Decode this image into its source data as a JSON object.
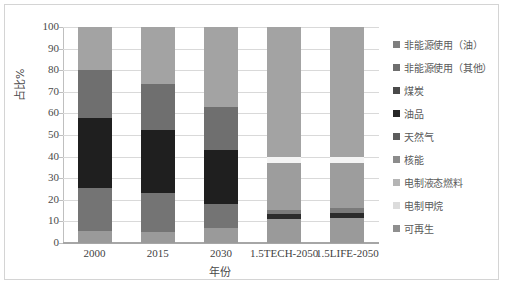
{
  "chart_data": {
    "type": "bar",
    "subtype": "stacked-100-percent",
    "title": "",
    "xlabel": "年份",
    "ylabel": "占比%",
    "ylim": [
      0,
      100
    ],
    "yticks": [
      0,
      10,
      20,
      30,
      40,
      50,
      60,
      70,
      80,
      90,
      100
    ],
    "ytick_labels": [
      "0",
      "10",
      "20",
      "30",
      "40",
      "50",
      "60",
      "70",
      "80",
      "90",
      "100"
    ],
    "grid": true,
    "legend_position": "right",
    "categories": [
      "2000",
      "2015",
      "2030",
      "1.5TECH-2050",
      "1.5LIFE-2050"
    ],
    "stack_order_bottom_up": [
      "可再生",
      "电制甲烷",
      "电制液态燃料",
      "核能",
      "天然气",
      "油品",
      "煤炭",
      "非能源使用（其他）",
      "非能源使用（油）"
    ],
    "series": [
      {
        "name": "可再生",
        "color": "#a6a6a6",
        "values": [
          5.5,
          5.0,
          7.0,
          11.0,
          11.5
        ]
      },
      {
        "name": "电制甲烷",
        "color": "#f2f2f2",
        "values": [
          0,
          0,
          0,
          0,
          0
        ]
      },
      {
        "name": "电制液态燃料",
        "color": "#d9d9d9",
        "values": [
          0,
          0,
          0,
          0,
          0
        ]
      },
      {
        "name": "核能",
        "color": "#8c8c8c",
        "values": [
          0,
          0,
          0,
          2.5,
          2.5
        ]
      },
      {
        "name": "天然气",
        "color": "#262626",
        "values": [
          0,
          0,
          0,
          2.5,
          2.5
        ]
      },
      {
        "name": "油品",
        "color": "#7f7f7f",
        "values": [
          20.0,
          18.0,
          11.0,
          21.0,
          20.5
        ]
      },
      {
        "name": "煤炭",
        "color": "#808080",
        "values": [
          0,
          0,
          0,
          0,
          0
        ]
      },
      {
        "name": "非能源使用（其他）",
        "color": "#f7f7f7",
        "values": [
          0,
          0,
          0,
          3.0,
          3.0
        ]
      },
      {
        "name": "非能源使用（油）",
        "color": "#a8a8a8",
        "values": [
          0,
          0,
          0,
          60.0,
          60.0
        ]
      }
    ],
    "bars": [
      {
        "category": "2000",
        "segments": [
          {
            "name": "可再生",
            "value": 5.5,
            "from": 0,
            "to": 5.5,
            "color": "#9a9a9a"
          },
          {
            "name": "天然气",
            "value": 20.0,
            "from": 5.5,
            "to": 25.5,
            "color": "#747474"
          },
          {
            "name": "油品",
            "value": 32.5,
            "from": 25.5,
            "to": 58.0,
            "color": "#1f1f1f"
          },
          {
            "name": "煤炭",
            "value": 22.0,
            "from": 58.0,
            "to": 80.0,
            "color": "#6f6f6f"
          },
          {
            "name": "非能源使用（其他）",
            "value": 20.0,
            "from": 80.0,
            "to": 100.0,
            "color": "#a3a3a3"
          }
        ]
      },
      {
        "category": "2015",
        "segments": [
          {
            "name": "可再生",
            "value": 5.0,
            "from": 0,
            "to": 5.0,
            "color": "#9a9a9a"
          },
          {
            "name": "天然气",
            "value": 18.0,
            "from": 5.0,
            "to": 23.0,
            "color": "#747474"
          },
          {
            "name": "油品",
            "value": 29.5,
            "from": 23.0,
            "to": 52.5,
            "color": "#1f1f1f"
          },
          {
            "name": "煤炭",
            "value": 21.0,
            "from": 52.5,
            "to": 73.5,
            "color": "#6f6f6f"
          },
          {
            "name": "非能源使用（其他）",
            "value": 26.5,
            "from": 73.5,
            "to": 100.0,
            "color": "#a3a3a3"
          }
        ]
      },
      {
        "category": "2030",
        "segments": [
          {
            "name": "可再生",
            "value": 7.0,
            "from": 0,
            "to": 7.0,
            "color": "#9a9a9a"
          },
          {
            "name": "天然气",
            "value": 11.0,
            "from": 7.0,
            "to": 18.0,
            "color": "#747474"
          },
          {
            "name": "油品",
            "value": 25.0,
            "from": 18.0,
            "to": 43.0,
            "color": "#1f1f1f"
          },
          {
            "name": "煤炭",
            "value": 20.0,
            "from": 43.0,
            "to": 63.0,
            "color": "#6f6f6f"
          },
          {
            "name": "非能源使用（其他）",
            "value": 37.0,
            "from": 63.0,
            "to": 100.0,
            "color": "#a3a3a3"
          }
        ]
      },
      {
        "category": "1.5TECH-2050",
        "segments": [
          {
            "name": "可再生",
            "value": 11.0,
            "from": 0,
            "to": 11.0,
            "color": "#9a9a9a"
          },
          {
            "name": "电制甲烷",
            "value": 2.5,
            "from": 11.0,
            "to": 13.5,
            "color": "#2b2b2b"
          },
          {
            "name": "电制液态燃料",
            "value": 2.0,
            "from": 13.5,
            "to": 15.5,
            "color": "#7a7a7a"
          },
          {
            "name": "核能",
            "value": 21.5,
            "from": 15.5,
            "to": 37.0,
            "color": "#9d9d9d"
          },
          {
            "name": "天然气",
            "value": 3.0,
            "from": 37.0,
            "to": 40.0,
            "color": "#f4f4f4"
          },
          {
            "name": "非能源使用（其他）",
            "value": 60.0,
            "from": 40.0,
            "to": 100.0,
            "color": "#a3a3a3"
          }
        ]
      },
      {
        "category": "1.5LIFE-2050",
        "segments": [
          {
            "name": "可再生",
            "value": 11.5,
            "from": 0,
            "to": 11.5,
            "color": "#9a9a9a"
          },
          {
            "name": "电制甲烷",
            "value": 2.5,
            "from": 11.5,
            "to": 14.0,
            "color": "#2b2b2b"
          },
          {
            "name": "电制液态燃料",
            "value": 2.0,
            "from": 14.0,
            "to": 16.0,
            "color": "#7a7a7a"
          },
          {
            "name": "核能",
            "value": 21.0,
            "from": 16.0,
            "to": 37.0,
            "color": "#9d9d9d"
          },
          {
            "name": "天然气",
            "value": 3.0,
            "from": 37.0,
            "to": 40.0,
            "color": "#f4f4f4"
          },
          {
            "name": "非能源使用（其他）",
            "value": 60.0,
            "from": 40.0,
            "to": 100.0,
            "color": "#a3a3a3"
          }
        ]
      }
    ],
    "legend": [
      {
        "label": "非能源使用（油）",
        "color": "#7f7f7f"
      },
      {
        "label": "非能源使用（其他）",
        "color": "#6e6e6e"
      },
      {
        "label": "煤炭",
        "color": "#4a4a4a"
      },
      {
        "label": "油品",
        "color": "#262626"
      },
      {
        "label": "天然气",
        "color": "#5c5c5c"
      },
      {
        "label": "核能",
        "color": "#8c8c8c"
      },
      {
        "label": "电制液态燃料",
        "color": "#b5b5b5"
      },
      {
        "label": "电制甲烷",
        "color": "#dcdcdc"
      },
      {
        "label": "可再生",
        "color": "#8f8f8f"
      }
    ]
  }
}
